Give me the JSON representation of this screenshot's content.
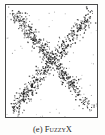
{
  "figure": {
    "caption_label": "(e)",
    "caption_title": "FuzzyX",
    "frame_color": "#4a4a4a",
    "background_color": "#ffffff",
    "point_color": "#1d1d1d"
  },
  "chart_data": {
    "type": "scatter",
    "title": "FuzzyX",
    "xlabel": "",
    "ylabel": "",
    "xlim": [
      0,
      1
    ],
    "ylim": [
      0,
      1
    ],
    "grid": false,
    "legend": null,
    "axis_ticks": false,
    "series": [
      {
        "name": "diagonal-down",
        "marker": "point",
        "color": "#1d1d1d",
        "x": [
          0.07,
          0.09,
          0.1,
          0.11,
          0.12,
          0.13,
          0.14,
          0.15,
          0.16,
          0.17,
          0.18,
          0.19,
          0.2,
          0.21,
          0.22,
          0.23,
          0.24,
          0.25,
          0.26,
          0.27,
          0.28,
          0.29,
          0.3,
          0.31,
          0.32,
          0.33,
          0.34,
          0.35,
          0.36,
          0.37,
          0.38,
          0.39,
          0.4,
          0.41,
          0.42,
          0.43,
          0.44,
          0.45,
          0.46,
          0.47,
          0.48,
          0.49,
          0.5,
          0.51,
          0.52,
          0.53,
          0.54,
          0.55,
          0.56,
          0.57,
          0.58,
          0.59,
          0.6,
          0.61,
          0.62,
          0.63,
          0.64,
          0.65,
          0.66,
          0.67,
          0.68,
          0.69,
          0.7,
          0.71,
          0.72,
          0.73,
          0.74,
          0.75,
          0.76,
          0.78,
          0.8,
          0.82,
          0.84,
          0.86,
          0.88,
          0.9,
          0.92
        ],
        "y": [
          0.93,
          0.92,
          0.91,
          0.9,
          0.89,
          0.88,
          0.87,
          0.86,
          0.85,
          0.84,
          0.83,
          0.82,
          0.81,
          0.8,
          0.79,
          0.78,
          0.77,
          0.76,
          0.75,
          0.74,
          0.73,
          0.72,
          0.71,
          0.7,
          0.69,
          0.68,
          0.67,
          0.66,
          0.65,
          0.64,
          0.63,
          0.62,
          0.61,
          0.6,
          0.59,
          0.58,
          0.57,
          0.56,
          0.55,
          0.54,
          0.53,
          0.52,
          0.51,
          0.5,
          0.49,
          0.48,
          0.47,
          0.46,
          0.45,
          0.44,
          0.43,
          0.42,
          0.41,
          0.4,
          0.39,
          0.38,
          0.37,
          0.36,
          0.35,
          0.34,
          0.33,
          0.32,
          0.31,
          0.3,
          0.29,
          0.28,
          0.27,
          0.26,
          0.25,
          0.23,
          0.21,
          0.19,
          0.17,
          0.15,
          0.13,
          0.11,
          0.09
        ]
      },
      {
        "name": "diagonal-up",
        "marker": "point",
        "color": "#1d1d1d",
        "x": [
          0.07,
          0.09,
          0.11,
          0.13,
          0.15,
          0.17,
          0.19,
          0.21,
          0.23,
          0.25,
          0.27,
          0.29,
          0.31,
          0.33,
          0.35,
          0.37,
          0.39,
          0.41,
          0.43,
          0.45,
          0.47,
          0.49,
          0.51,
          0.53,
          0.55,
          0.57,
          0.59,
          0.61,
          0.63,
          0.65,
          0.67,
          0.69,
          0.71,
          0.73,
          0.75,
          0.77,
          0.79,
          0.81,
          0.83,
          0.85,
          0.87,
          0.89,
          0.91,
          0.93
        ],
        "y": [
          0.07,
          0.09,
          0.11,
          0.13,
          0.15,
          0.17,
          0.19,
          0.21,
          0.23,
          0.25,
          0.27,
          0.29,
          0.31,
          0.33,
          0.35,
          0.37,
          0.39,
          0.41,
          0.43,
          0.45,
          0.47,
          0.49,
          0.51,
          0.53,
          0.55,
          0.57,
          0.59,
          0.61,
          0.63,
          0.65,
          0.67,
          0.69,
          0.71,
          0.73,
          0.75,
          0.77,
          0.79,
          0.81,
          0.83,
          0.85,
          0.87,
          0.89,
          0.91,
          0.93
        ]
      }
    ],
    "noise": {
      "band_sigma": 0.035,
      "points_per_band": 480,
      "sparse_background_points": 55
    }
  }
}
